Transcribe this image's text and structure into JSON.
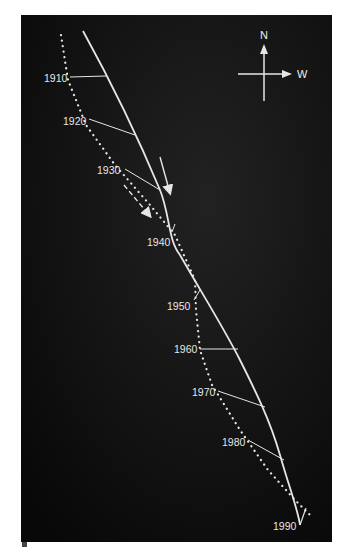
{
  "figure": {
    "panel_label": "a",
    "background": "#0c0c0c",
    "line_color": "#e6e6e6"
  },
  "compass": {
    "north_label": "N",
    "west_label": "W"
  },
  "year_labels": [
    "1910",
    "1920",
    "1930",
    "1940",
    "1950",
    "1960",
    "1970",
    "1980",
    "1990"
  ],
  "legend": {
    "solid_line": "observed position (solid)",
    "dotted_line": "reference position (dotted)",
    "solid_arrow": "solid migration arrow",
    "dashed_arrow": "dashed migration arrow"
  }
}
